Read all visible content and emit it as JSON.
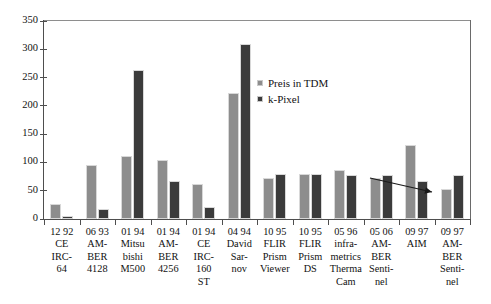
{
  "chart_data": {
    "type": "bar",
    "title": "",
    "xlabel": "",
    "ylabel": "",
    "ylim": [
      0,
      350
    ],
    "yticks": [
      0,
      50,
      100,
      150,
      200,
      250,
      300,
      350
    ],
    "grid": false,
    "legend_position": "inside-upper-center",
    "categories": [
      "12 92\nCE\nIRC-\n64",
      "06 93\nAM-\nBER\n4128",
      "01 94\nMitsu\nbishi\nM500",
      "01 94\nAM-\nBER\n4256",
      "01 94\nCE\nIRC-\n160\nST",
      "04 94\nDavid\nSar-\nnov",
      "10 95\nFLIR\nPrism\nViewer",
      "10 95\nFLIR\nPrism\nDS",
      "05 96\ninfra-\nmetrics\nTherma\nCam",
      "05 06\nAM-\nBER\nSenti-\nnel",
      "09 97\nAIM",
      "09 97\nAM-\nBER\nSenti-\nnel"
    ],
    "series": [
      {
        "name": "Preis in TDM",
        "color": "#8d8d8d",
        "values": [
          27,
          96,
          112,
          104,
          62,
          223,
          73,
          79,
          87,
          72,
          131,
          53
        ]
      },
      {
        "name": "k-Pixel",
        "color": "#3b3b3b",
        "values": [
          5,
          17,
          264,
          67,
          21,
          309,
          79,
          79,
          77,
          78,
          68,
          78
        ]
      }
    ],
    "annotations": [
      {
        "type": "arrow",
        "name": "declining-trend-arrow",
        "from": [
          370,
          178
        ],
        "to": [
          432,
          192
        ],
        "color": "#1a1a1a"
      }
    ]
  },
  "legend": {
    "items": [
      {
        "label": "Preis in TDM"
      },
      {
        "label": "k-Pixel"
      }
    ]
  },
  "axes": {
    "y": {
      "ticks": [
        "0",
        "50",
        "100",
        "150",
        "200",
        "250",
        "300",
        "350"
      ]
    }
  }
}
